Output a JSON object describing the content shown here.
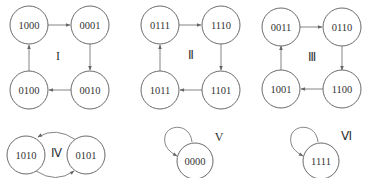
{
  "diagram": {
    "type": "state-transition",
    "cycles": [
      {
        "label": "I",
        "states": [
          "1000",
          "0001",
          "0010",
          "0100"
        ]
      },
      {
        "label": "II",
        "states": [
          "0111",
          "1110",
          "1101",
          "1011"
        ]
      },
      {
        "label": "III",
        "states": [
          "0011",
          "0110",
          "1100",
          "1001"
        ]
      },
      {
        "label": "IV",
        "states": [
          "1010",
          "0101"
        ]
      },
      {
        "label": "V",
        "states": [
          "0000"
        ]
      },
      {
        "label": "VI",
        "states": [
          "1111"
        ]
      }
    ]
  },
  "labels": {
    "c1": "I",
    "c2": "Ⅱ",
    "c3": "Ⅲ",
    "c4": "Ⅳ",
    "c5": "V",
    "c6": "Ⅵ"
  },
  "nodes": {
    "n1000": "1000",
    "n0001": "0001",
    "n0010": "0010",
    "n0100": "0100",
    "n0111": "0111",
    "n1110": "1110",
    "n1101": "1101",
    "n1011": "1011",
    "n0011": "0011",
    "n0110": "0110",
    "n1100": "1100",
    "n1001": "1001",
    "n1010": "1010",
    "n0101": "0101",
    "n0000": "0000",
    "n1111": "1111"
  }
}
